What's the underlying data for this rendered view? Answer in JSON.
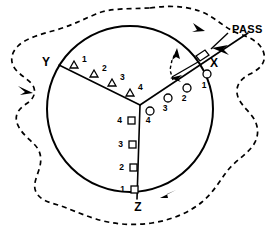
{
  "figure": {
    "title": "PASS",
    "axis_labels": {
      "x": "X",
      "y": "Y",
      "z": "Z"
    },
    "colors": {
      "ink": "#000000",
      "background": "#ffffff"
    },
    "annotation": {
      "pass_label": "PASS"
    },
    "series": [
      {
        "name": "triangle-arm-y",
        "marker": "triangle",
        "arm": "Y",
        "points": [
          {
            "label": "1",
            "cx": 74,
            "cy": 65,
            "tx": 82,
            "ty": 62
          },
          {
            "label": "2",
            "cx": 94,
            "cy": 74,
            "tx": 102,
            "ty": 71
          },
          {
            "label": "3",
            "cx": 112,
            "cy": 83,
            "tx": 120,
            "ty": 80
          },
          {
            "label": "4",
            "cx": 130,
            "cy": 93,
            "tx": 138,
            "ty": 90
          }
        ]
      },
      {
        "name": "circle-arm-x",
        "marker": "circle",
        "arm": "X",
        "points": [
          {
            "label": "1",
            "cx": 207,
            "cy": 72,
            "tx": 205,
            "ty": 85
          },
          {
            "label": "2",
            "cx": 186,
            "cy": 87,
            "tx": 184,
            "ty": 99
          },
          {
            "label": "3",
            "cx": 168,
            "cy": 97,
            "tx": 166,
            "ty": 109
          },
          {
            "label": "4",
            "cx": 149,
            "cy": 110,
            "tx": 148,
            "ty": 121
          }
        ]
      },
      {
        "name": "square-arm-z",
        "marker": "square",
        "arm": "Z",
        "points": [
          {
            "label": "4",
            "cx": 131,
            "cy": 120,
            "tx": 120,
            "ty": 121
          },
          {
            "label": "3",
            "cx": 133,
            "cy": 144,
            "tx": 122,
            "ty": 145
          },
          {
            "label": "2",
            "cx": 134,
            "cy": 167,
            "tx": 123,
            "ty": 168
          },
          {
            "label": "1",
            "cx": 135,
            "cy": 189,
            "tx": 124,
            "ty": 190
          }
        ]
      }
    ],
    "geometry": {
      "circle": {
        "cx": 130,
        "cy": 109,
        "r": 83
      },
      "center": {
        "x": 140,
        "y": 105
      }
    }
  }
}
